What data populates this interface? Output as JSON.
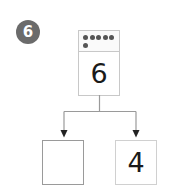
{
  "problem": {
    "number": "6"
  },
  "whole": {
    "value": "6",
    "dots": 6
  },
  "parts": {
    "left": "",
    "right": "4"
  },
  "colors": {
    "badge": "#6b6b6b",
    "dot": "#555555",
    "line": "#9a9a9a",
    "box_border_light": "#d0d0d0",
    "box_border_dark": "#9a9a9a"
  }
}
